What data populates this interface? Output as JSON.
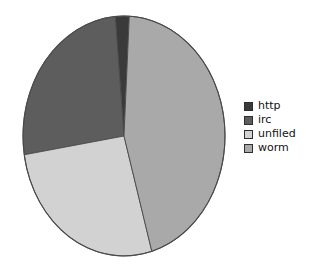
{
  "chart_data": {
    "type": "pie",
    "title": "",
    "subtitle": "",
    "xlabel": "",
    "ylabel": "",
    "grid": false,
    "legend_position": "right",
    "categories": [
      "http",
      "irc",
      "unfiled",
      "worm"
    ],
    "values": [
      2,
      26,
      27,
      45
    ],
    "unit": "percent",
    "slices": [
      {
        "label": "http",
        "value": 2,
        "percent": 2,
        "color": "#3a3a3a",
        "start_angle": 355,
        "end_angle": 3
      },
      {
        "label": "irc",
        "value": 26,
        "percent": 26,
        "color": "#5d5d5d",
        "start_angle": 261,
        "end_angle": 355
      },
      {
        "label": "unfiled",
        "value": 27,
        "percent": 27,
        "color": "#d2d2d2",
        "start_angle": 164,
        "end_angle": 261
      },
      {
        "label": "worm",
        "value": 45,
        "percent": 45,
        "color": "#a9a9a9",
        "start_angle": 3,
        "end_angle": 164
      }
    ],
    "annotations": []
  },
  "legend": {
    "items": [
      {
        "label": "http",
        "color": "#3a3a3a"
      },
      {
        "label": "irc",
        "color": "#5d5d5d"
      },
      {
        "label": "unfiled",
        "color": "#d2d2d2"
      },
      {
        "label": "worm",
        "color": "#a9a9a9"
      }
    ]
  },
  "style": {
    "background": "#ffffff",
    "outline": "#4a4a4a",
    "text": "#121212"
  },
  "geometry": {
    "cx": 124,
    "cy": 136,
    "rx": 101,
    "ry": 120
  }
}
